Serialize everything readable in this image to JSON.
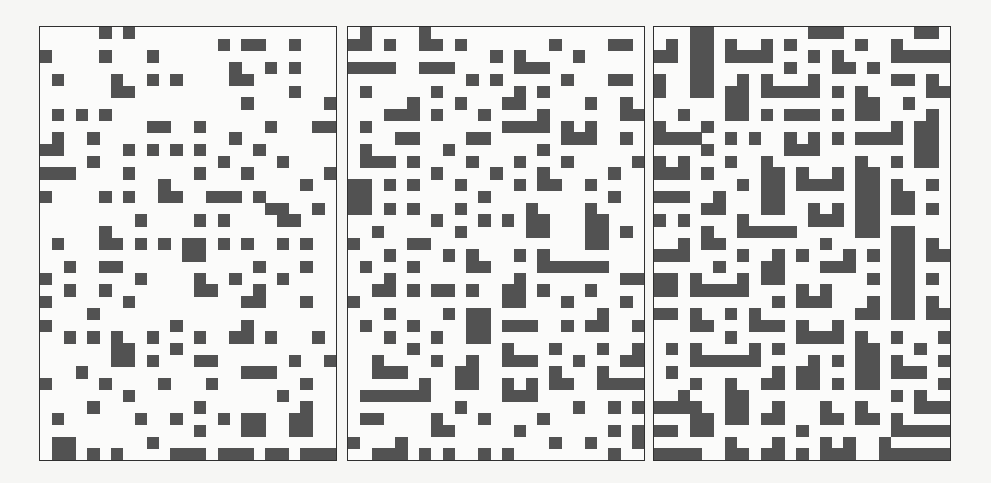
{
  "figure": {
    "grid": {
      "cols": 25,
      "rows": 37
    },
    "colors": {
      "fill": "#525252",
      "background": "#fbfbfa",
      "border": "#2f2f2f"
    },
    "panels": [
      {
        "id": "panel-1",
        "label": "",
        "density": "sparse",
        "rows": [
          [
            5,
            7
          ],
          [
            15,
            17,
            18,
            21
          ],
          [
            0,
            5,
            9
          ],
          [
            16,
            19,
            21
          ],
          [
            1,
            6,
            9,
            11,
            16,
            17
          ],
          [
            6,
            7,
            21
          ],
          [
            17,
            24
          ],
          [
            1,
            3,
            5
          ],
          [
            9,
            10,
            13,
            19,
            23,
            24
          ],
          [
            1,
            4,
            16
          ],
          [
            0,
            1,
            7,
            9,
            11,
            13,
            18
          ],
          [
            4,
            15,
            20
          ],
          [
            0,
            1,
            2,
            7,
            13,
            17,
            24
          ],
          [
            10,
            22
          ],
          [
            0,
            5,
            7,
            10,
            11,
            14,
            15,
            16,
            18
          ],
          [
            19,
            20,
            23
          ],
          [
            8,
            13,
            15,
            20,
            21
          ],
          [
            5
          ],
          [
            1,
            5,
            6,
            8,
            10,
            12,
            13,
            15,
            17,
            20,
            22
          ],
          [
            12,
            13
          ],
          [
            2,
            5,
            6,
            18,
            22
          ],
          [
            0,
            8,
            13,
            16,
            20
          ],
          [
            2,
            5,
            13,
            14,
            18
          ],
          [
            0,
            7,
            17,
            18,
            22
          ],
          [
            4
          ],
          [
            0,
            11,
            17
          ],
          [
            2,
            4,
            6,
            9,
            13,
            16,
            17,
            19,
            23
          ],
          [
            6,
            7,
            11
          ],
          [
            6,
            7,
            9,
            13,
            14,
            21,
            24
          ],
          [
            3,
            17,
            18,
            19
          ],
          [
            0,
            5,
            10,
            14,
            22
          ],
          [
            7,
            20
          ],
          [
            4,
            13,
            22
          ],
          [
            1,
            8,
            11,
            15,
            17,
            18,
            21,
            22
          ],
          [
            13,
            17,
            18,
            21,
            22
          ],
          [
            1,
            2,
            9
          ],
          [
            1,
            2,
            4,
            6,
            11,
            12,
            13,
            15,
            16,
            17,
            19,
            20,
            22,
            23,
            24
          ]
        ]
      },
      {
        "id": "panel-2",
        "label": "",
        "density": "medium",
        "rows": [
          [
            1,
            6
          ],
          [
            0,
            1,
            3,
            6,
            7,
            9,
            17,
            22,
            23
          ],
          [
            12,
            14,
            19
          ],
          [
            0,
            1,
            2,
            3,
            6,
            7,
            8,
            14,
            15,
            16
          ],
          [
            10,
            12,
            18,
            22,
            23
          ],
          [
            1,
            7,
            14,
            16
          ],
          [
            5,
            9,
            13,
            14,
            20,
            23
          ],
          [
            3,
            4,
            5,
            7,
            11,
            16,
            23,
            24
          ],
          [
            1,
            13,
            14,
            15,
            16,
            18,
            20
          ],
          [
            4,
            5,
            10,
            11,
            18,
            19,
            20,
            23
          ],
          [
            1,
            8,
            16
          ],
          [
            1,
            2,
            3,
            5,
            10,
            14,
            18,
            24
          ],
          [
            7,
            12,
            16,
            22
          ],
          [
            0,
            1,
            3,
            5,
            9,
            14,
            16,
            17,
            20
          ],
          [
            0,
            1,
            11,
            22
          ],
          [
            0,
            1,
            3,
            5,
            9,
            15,
            20
          ],
          [
            7,
            11,
            13,
            15,
            16,
            20,
            21
          ],
          [
            2,
            9,
            15,
            16,
            20,
            21,
            23
          ],
          [
            0,
            5,
            6,
            20,
            21
          ],
          [
            3,
            8,
            10,
            14,
            16
          ],
          [
            1,
            5,
            10,
            11,
            16,
            17,
            18,
            19,
            20,
            21
          ],
          [
            3,
            14,
            23,
            24
          ],
          [
            2,
            3,
            5,
            7,
            8,
            10,
            13,
            14,
            16,
            20
          ],
          [
            0,
            13,
            14,
            18,
            23
          ],
          [
            3,
            8,
            10,
            11,
            21
          ],
          [
            1,
            5,
            10,
            11,
            13,
            14,
            15,
            18,
            20,
            21,
            24
          ],
          [
            3,
            7,
            10,
            11
          ],
          [
            5,
            13,
            17,
            21,
            24
          ],
          [
            2,
            7,
            10,
            13,
            14,
            15,
            19,
            23,
            24
          ],
          [
            2,
            3,
            4,
            9,
            10,
            17,
            21
          ],
          [
            6,
            9,
            10,
            13,
            15,
            17,
            18,
            21,
            22,
            23,
            24
          ],
          [
            1,
            2,
            3,
            4,
            5,
            6,
            13,
            14,
            15
          ],
          [
            9,
            19,
            22,
            24
          ],
          [
            1,
            2,
            7,
            11,
            16
          ],
          [
            7,
            8,
            14,
            22,
            24
          ],
          [
            0,
            4,
            17,
            20,
            24
          ],
          [
            2,
            3,
            4,
            6,
            8,
            11,
            13,
            22
          ]
        ]
      },
      {
        "id": "panel-3",
        "label": "",
        "density": "dense",
        "rows": [
          [
            3,
            4,
            13,
            14,
            15,
            22,
            23
          ],
          [
            1,
            3,
            4,
            6,
            9,
            11,
            17,
            20
          ],
          [
            0,
            1,
            3,
            4,
            6,
            7,
            8,
            9,
            13,
            15,
            20,
            21,
            22,
            23,
            24
          ],
          [
            3,
            4,
            11,
            15,
            16,
            18
          ],
          [
            0,
            3,
            4,
            7,
            9,
            13,
            20,
            21,
            23
          ],
          [
            0,
            3,
            4,
            6,
            7,
            9,
            10,
            11,
            12,
            13,
            15,
            17,
            23,
            24
          ],
          [
            6,
            7,
            17,
            18,
            21
          ],
          [
            2,
            6,
            7,
            9,
            11,
            12,
            13,
            15,
            17,
            18,
            23
          ],
          [
            0,
            4,
            20,
            22,
            23
          ],
          [
            0,
            1,
            2,
            3,
            6,
            8,
            11,
            13,
            15,
            17,
            18,
            19,
            20,
            22,
            23
          ],
          [
            4,
            11,
            12,
            13,
            22,
            23
          ],
          [
            0,
            2,
            6,
            9,
            17,
            20,
            22,
            23
          ],
          [
            0,
            1,
            2,
            4,
            9,
            10,
            12,
            15,
            17,
            18
          ],
          [
            7,
            9,
            10,
            12,
            13,
            14,
            15,
            17,
            18,
            20,
            23
          ],
          [
            0,
            1,
            2,
            5,
            9,
            10,
            17,
            18,
            20,
            21
          ],
          [
            4,
            5,
            9,
            10,
            13,
            15,
            17,
            18,
            20,
            21,
            23
          ],
          [
            0,
            2,
            7,
            13,
            14,
            15,
            17,
            18
          ],
          [
            4,
            7,
            8,
            9,
            10,
            11,
            17,
            18,
            20,
            21
          ],
          [
            2,
            4,
            5,
            14,
            20,
            21,
            23
          ],
          [
            0,
            1,
            2,
            7,
            10,
            12,
            16,
            18,
            20,
            21,
            23,
            24
          ],
          [
            5,
            9,
            10,
            14,
            15,
            16,
            20,
            21
          ],
          [
            0,
            1,
            3,
            7,
            9,
            10,
            18,
            20,
            21,
            23
          ],
          [
            0,
            1,
            3,
            4,
            5,
            6,
            7,
            12,
            14,
            20,
            21
          ],
          [
            10,
            12,
            13,
            14,
            18,
            20,
            21,
            23
          ],
          [
            0,
            1,
            3,
            6,
            8,
            17,
            18,
            20,
            21,
            23,
            24
          ],
          [
            3,
            4,
            8,
            9,
            10,
            12,
            15
          ],
          [
            6,
            12,
            13,
            14,
            15,
            17,
            20,
            24
          ],
          [
            1,
            3,
            8,
            10,
            17,
            18,
            22
          ],
          [
            3,
            4,
            5,
            6,
            7,
            8,
            13,
            15,
            17,
            18,
            20,
            24
          ],
          [
            1,
            10,
            12,
            13,
            17,
            18,
            20,
            21,
            22
          ],
          [
            3,
            6,
            9,
            10,
            12,
            13,
            15,
            17,
            18,
            24
          ],
          [
            2,
            6,
            7,
            20,
            22
          ],
          [
            0,
            1,
            2,
            3,
            6,
            7,
            10,
            14,
            17,
            22,
            23,
            24
          ],
          [
            3,
            4,
            6,
            7,
            9,
            10,
            14,
            15,
            17,
            18,
            20
          ],
          [
            0,
            1,
            3,
            4,
            12,
            20,
            21,
            22,
            23,
            24
          ],
          [
            6,
            10,
            14,
            16,
            19
          ],
          [
            0,
            1,
            2,
            3,
            6,
            7,
            9,
            10,
            12,
            14,
            15,
            16,
            19,
            20,
            21,
            22,
            23,
            24
          ]
        ]
      }
    ]
  }
}
